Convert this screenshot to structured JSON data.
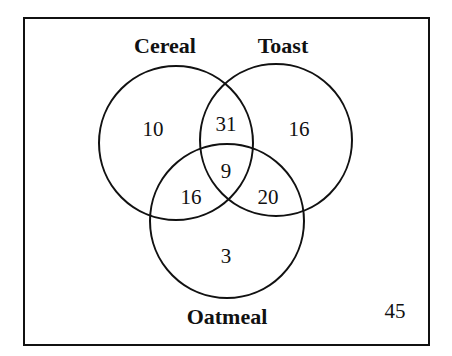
{
  "diagram": {
    "type": "venn",
    "sets": [
      "Cereal",
      "Toast",
      "Oatmeal"
    ],
    "labels": {
      "cereal": "Cereal",
      "toast": "Toast",
      "oatmeal": "Oatmeal"
    },
    "regions": {
      "cereal_only": "10",
      "toast_only": "16",
      "oatmeal_only": "3",
      "cereal_toast_only": "31",
      "cereal_oatmeal_only": "16",
      "toast_oatmeal_only": "20",
      "all_three": "9",
      "outside": "45"
    },
    "colors": {
      "stroke": "#111111",
      "background": "#ffffff"
    }
  }
}
